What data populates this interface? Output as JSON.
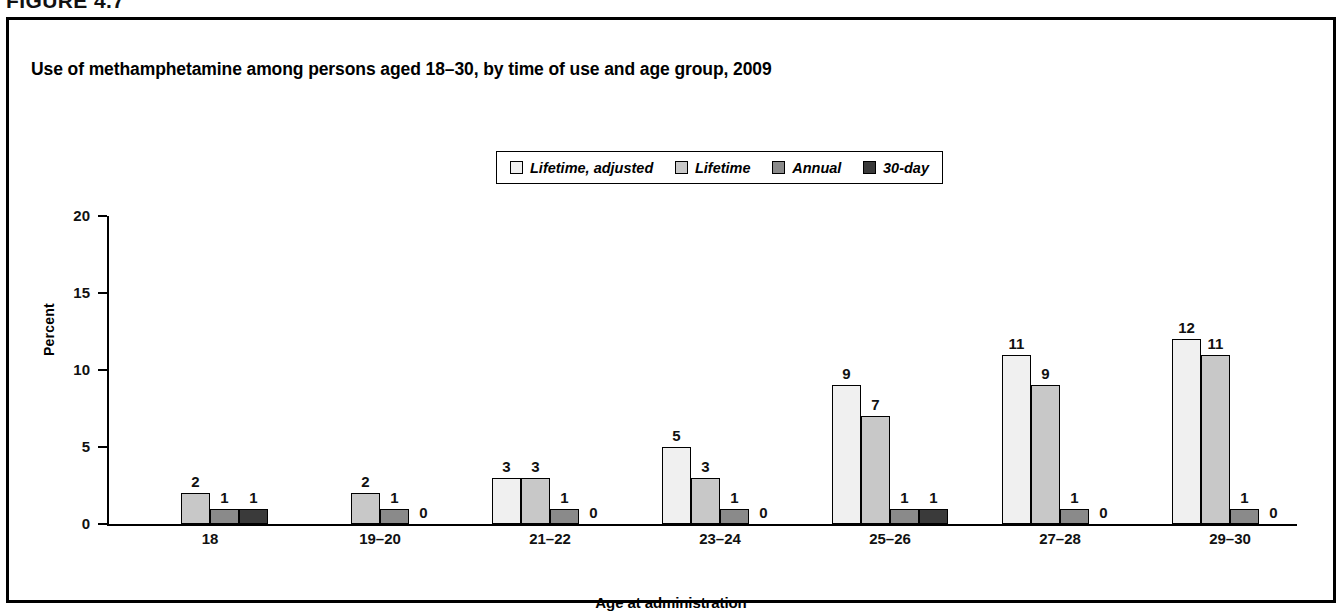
{
  "figure_number": "FIGURE 4.7",
  "title": "Use of methamphetamine among persons aged 18–30, by time of use and age group, 2009",
  "axis": {
    "ylabel": "Percent",
    "xlabel": "Age at administration",
    "yticks": [
      "0",
      "5",
      "10",
      "15",
      "20"
    ]
  },
  "legend": {
    "items": [
      {
        "label": "Lifetime, adjusted",
        "color": "#f0f0f0"
      },
      {
        "label": "Lifetime",
        "color": "#c8c8c8"
      },
      {
        "label": "Annual",
        "color": "#8a8a8a"
      },
      {
        "label": "30-day",
        "color": "#3a3a3a"
      }
    ]
  },
  "chart_data": {
    "type": "bar",
    "title": "Use of methamphetamine among persons aged 18–30, by time of use and age group, 2009",
    "xlabel": "Age at administration",
    "ylabel": "Percent",
    "ylim": [
      0,
      20
    ],
    "yticks": [
      0,
      5,
      10,
      15,
      20
    ],
    "grid": false,
    "legend_position": "top-center",
    "categories": [
      "18",
      "19–20",
      "21–22",
      "23–24",
      "25–26",
      "27–28",
      "29–30"
    ],
    "series": [
      {
        "name": "Lifetime, adjusted",
        "color": "#f0f0f0",
        "values": [
          null,
          null,
          3,
          5,
          9,
          11,
          12
        ]
      },
      {
        "name": "Lifetime",
        "color": "#c8c8c8",
        "values": [
          2,
          2,
          3,
          3,
          7,
          9,
          11
        ]
      },
      {
        "name": "Annual",
        "color": "#8a8a8a",
        "values": [
          1,
          1,
          1,
          1,
          1,
          1,
          1
        ]
      },
      {
        "name": "30-day",
        "color": "#3a3a3a",
        "values": [
          1,
          0,
          0,
          0,
          1,
          0,
          0
        ]
      }
    ],
    "value_labels": [
      {
        "category": "18",
        "labels": [
          "",
          "2",
          "1",
          "1"
        ]
      },
      {
        "category": "19–20",
        "labels": [
          "",
          "2",
          "1",
          "0"
        ]
      },
      {
        "category": "21–22",
        "labels": [
          "3",
          "3",
          "1",
          "0"
        ]
      },
      {
        "category": "23–24",
        "labels": [
          "5",
          "3",
          "1",
          "0"
        ]
      },
      {
        "category": "25–26",
        "labels": [
          "9",
          "7",
          "1",
          "1"
        ]
      },
      {
        "category": "27–28",
        "labels": [
          "11",
          "9",
          "1",
          "0"
        ]
      },
      {
        "category": "29–30",
        "labels": [
          "12",
          "11",
          "1",
          "0"
        ]
      }
    ]
  }
}
